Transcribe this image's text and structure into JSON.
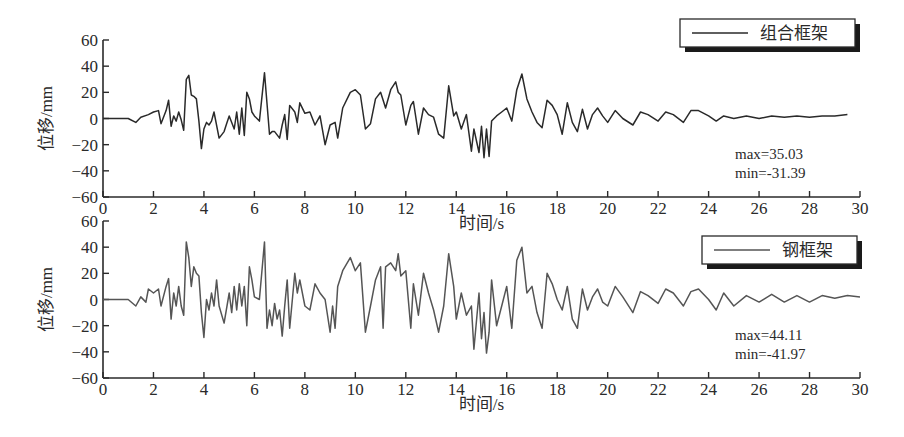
{
  "figure": {
    "xlabel": "时间/s",
    "ylabel": "位移/mm"
  },
  "chart_data": [
    {
      "type": "line",
      "title": "",
      "xlabel": "时间/s",
      "ylabel": "位移/mm",
      "xlim": [
        0,
        30
      ],
      "ylim": [
        -60,
        60
      ],
      "xticks": [
        "0",
        "2",
        "4",
        "6",
        "8",
        "10",
        "12",
        "14",
        "16",
        "18",
        "20",
        "22",
        "24",
        "26",
        "28",
        "30"
      ],
      "yticks": [
        "60",
        "40",
        "20",
        "0",
        "-20",
        "-40",
        "-60"
      ],
      "grid": false,
      "legend": {
        "position": "upper right",
        "entries": [
          "组合框架"
        ]
      },
      "annotations": [
        "max=35.03",
        "min=-31.39"
      ],
      "series": [
        {
          "name": "组合框架",
          "color": "#2a2a2a",
          "x": [
            0,
            0.5,
            1.0,
            1.3,
            1.5,
            1.8,
            2.0,
            2.2,
            2.3,
            2.5,
            2.6,
            2.7,
            2.8,
            2.9,
            3.0,
            3.1,
            3.2,
            3.3,
            3.4,
            3.5,
            3.6,
            3.7,
            3.8,
            3.9,
            4.0,
            4.1,
            4.2,
            4.3,
            4.4,
            4.6,
            4.8,
            4.9,
            5.0,
            5.2,
            5.3,
            5.4,
            5.5,
            5.6,
            5.7,
            5.8,
            5.9,
            6.0,
            6.2,
            6.4,
            6.6,
            6.7,
            6.8,
            7.0,
            7.1,
            7.2,
            7.3,
            7.4,
            7.6,
            7.7,
            7.8,
            8.0,
            8.2,
            8.4,
            8.6,
            8.8,
            9.0,
            9.2,
            9.3,
            9.5,
            9.8,
            10.0,
            10.2,
            10.4,
            10.6,
            10.8,
            11.0,
            11.2,
            11.4,
            11.6,
            11.7,
            11.8,
            12.0,
            12.2,
            12.3,
            12.5,
            12.7,
            12.9,
            13.1,
            13.3,
            13.5,
            13.7,
            13.9,
            14.0,
            14.2,
            14.4,
            14.6,
            14.7,
            14.9,
            15.0,
            15.1,
            15.2,
            15.3,
            15.4,
            15.6,
            15.8,
            16.0,
            16.2,
            16.4,
            16.6,
            16.8,
            17.0,
            17.2,
            17.4,
            17.6,
            17.8,
            18.0,
            18.2,
            18.4,
            18.6,
            18.8,
            19.0,
            19.2,
            19.4,
            19.6,
            19.8,
            20.0,
            20.3,
            20.6,
            21.0,
            21.3,
            21.6,
            22.0,
            22.3,
            22.6,
            23.0,
            23.3,
            23.6,
            24.0,
            24.3,
            24.6,
            25.0,
            25.5,
            26.0,
            26.5,
            27.0,
            27.5,
            28.0,
            28.5,
            29.0,
            29.5,
            30.0
          ],
          "values": [
            0,
            0,
            0,
            -3,
            1,
            3,
            5,
            6,
            -4,
            6,
            14,
            -6,
            2,
            -2,
            5,
            -1,
            -9,
            30,
            33,
            18,
            17,
            15,
            -2,
            -23,
            -8,
            -3,
            -5,
            -2,
            5,
            -15,
            -10,
            -4,
            2,
            -8,
            5,
            -12,
            8,
            -13,
            20,
            15,
            5,
            2,
            -2,
            35,
            -12,
            -10,
            -10,
            -15,
            -5,
            3,
            -16,
            10,
            5,
            -3,
            12,
            4,
            5,
            -5,
            2,
            -20,
            -5,
            -3,
            -15,
            8,
            20,
            22,
            18,
            -8,
            -4,
            15,
            20,
            8,
            22,
            28,
            20,
            18,
            -5,
            10,
            13,
            -12,
            8,
            3,
            1,
            -12,
            -15,
            25,
            2,
            5,
            -8,
            3,
            -25,
            -8,
            -26,
            -6,
            -30,
            -8,
            -29,
            -2,
            2,
            5,
            8,
            -2,
            22,
            34,
            15,
            5,
            -3,
            -7,
            14,
            10,
            3,
            -12,
            12,
            -3,
            -10,
            7,
            -8,
            3,
            8,
            2,
            -3,
            6,
            0,
            -5,
            5,
            3,
            -2,
            5,
            3,
            -3,
            6,
            6,
            2,
            -2,
            2,
            0,
            2,
            0,
            2,
            1,
            2,
            1,
            2,
            2,
            3
          ]
        }
      ]
    },
    {
      "type": "line",
      "title": "",
      "xlabel": "时间/s",
      "ylabel": "位移/mm",
      "xlim": [
        0,
        30
      ],
      "ylim": [
        -60,
        60
      ],
      "xticks": [
        "0",
        "2",
        "4",
        "6",
        "8",
        "10",
        "12",
        "14",
        "16",
        "18",
        "20",
        "22",
        "24",
        "26",
        "28",
        "30"
      ],
      "yticks": [
        "60",
        "40",
        "20",
        "0",
        "-20",
        "-40",
        "-60"
      ],
      "grid": false,
      "legend": {
        "position": "upper right",
        "entries": [
          "钢框架"
        ]
      },
      "annotations": [
        "max=44.11",
        "min=-41.97"
      ],
      "series": [
        {
          "name": "钢框架",
          "color": "#555555",
          "x": [
            0,
            0.5,
            1.0,
            1.3,
            1.5,
            1.7,
            1.8,
            2.0,
            2.2,
            2.3,
            2.5,
            2.6,
            2.7,
            2.8,
            2.9,
            3.0,
            3.1,
            3.2,
            3.3,
            3.4,
            3.5,
            3.6,
            3.7,
            3.8,
            3.9,
            4.0,
            4.1,
            4.2,
            4.3,
            4.4,
            4.5,
            4.6,
            4.8,
            5.0,
            5.1,
            5.2,
            5.3,
            5.4,
            5.5,
            5.6,
            5.7,
            5.8,
            5.9,
            6.0,
            6.2,
            6.4,
            6.5,
            6.6,
            6.7,
            6.8,
            6.9,
            7.0,
            7.1,
            7.2,
            7.3,
            7.4,
            7.6,
            7.7,
            7.8,
            8.0,
            8.2,
            8.4,
            8.6,
            8.8,
            9.0,
            9.1,
            9.2,
            9.3,
            9.5,
            9.8,
            10.0,
            10.2,
            10.4,
            10.6,
            10.8,
            11.0,
            11.1,
            11.2,
            11.4,
            11.6,
            11.7,
            11.8,
            12.0,
            12.2,
            12.3,
            12.5,
            12.7,
            12.9,
            13.1,
            13.3,
            13.5,
            13.7,
            13.9,
            14.0,
            14.2,
            14.4,
            14.6,
            14.7,
            14.9,
            15.0,
            15.1,
            15.2,
            15.3,
            15.4,
            15.6,
            15.8,
            16.0,
            16.2,
            16.4,
            16.6,
            16.8,
            17.0,
            17.2,
            17.4,
            17.6,
            17.8,
            18.0,
            18.2,
            18.4,
            18.6,
            18.8,
            19.0,
            19.2,
            19.4,
            19.6,
            19.8,
            20.0,
            20.3,
            20.6,
            21.0,
            21.3,
            21.6,
            22.0,
            22.3,
            22.6,
            23.0,
            23.3,
            23.6,
            24.0,
            24.3,
            24.6,
            25.0,
            25.5,
            26.0,
            26.5,
            27.0,
            27.5,
            28.0,
            28.5,
            29.0,
            29.5,
            30.0
          ],
          "values": [
            0,
            0,
            0,
            -5,
            2,
            -2,
            8,
            5,
            8,
            -5,
            10,
            16,
            -15,
            5,
            -5,
            10,
            -5,
            -12,
            44,
            32,
            10,
            25,
            20,
            18,
            -10,
            -29,
            0,
            -8,
            5,
            -5,
            15,
            -5,
            -18,
            5,
            -10,
            10,
            -8,
            12,
            -5,
            10,
            -20,
            25,
            15,
            2,
            0,
            44,
            -22,
            -8,
            -20,
            -3,
            -15,
            -8,
            -28,
            -5,
            15,
            -22,
            20,
            5,
            15,
            -5,
            -8,
            12,
            5,
            0,
            -25,
            -5,
            -22,
            10,
            22,
            32,
            22,
            28,
            -25,
            -5,
            15,
            25,
            -22,
            25,
            28,
            22,
            35,
            18,
            22,
            -22,
            12,
            -12,
            20,
            5,
            -8,
            -25,
            -5,
            35,
            10,
            -15,
            5,
            -12,
            -5,
            -38,
            5,
            -30,
            -10,
            -41,
            -25,
            15,
            -20,
            -5,
            10,
            -22,
            30,
            40,
            5,
            10,
            -10,
            -22,
            20,
            12,
            0,
            -8,
            10,
            -15,
            -22,
            8,
            -8,
            2,
            8,
            -2,
            -5,
            10,
            2,
            -10,
            6,
            3,
            -3,
            8,
            5,
            -5,
            6,
            8,
            0,
            -8,
            5,
            -5,
            3,
            -2,
            4,
            -2,
            3,
            -2,
            3,
            1,
            3,
            2,
            4
          ]
        }
      ]
    }
  ]
}
